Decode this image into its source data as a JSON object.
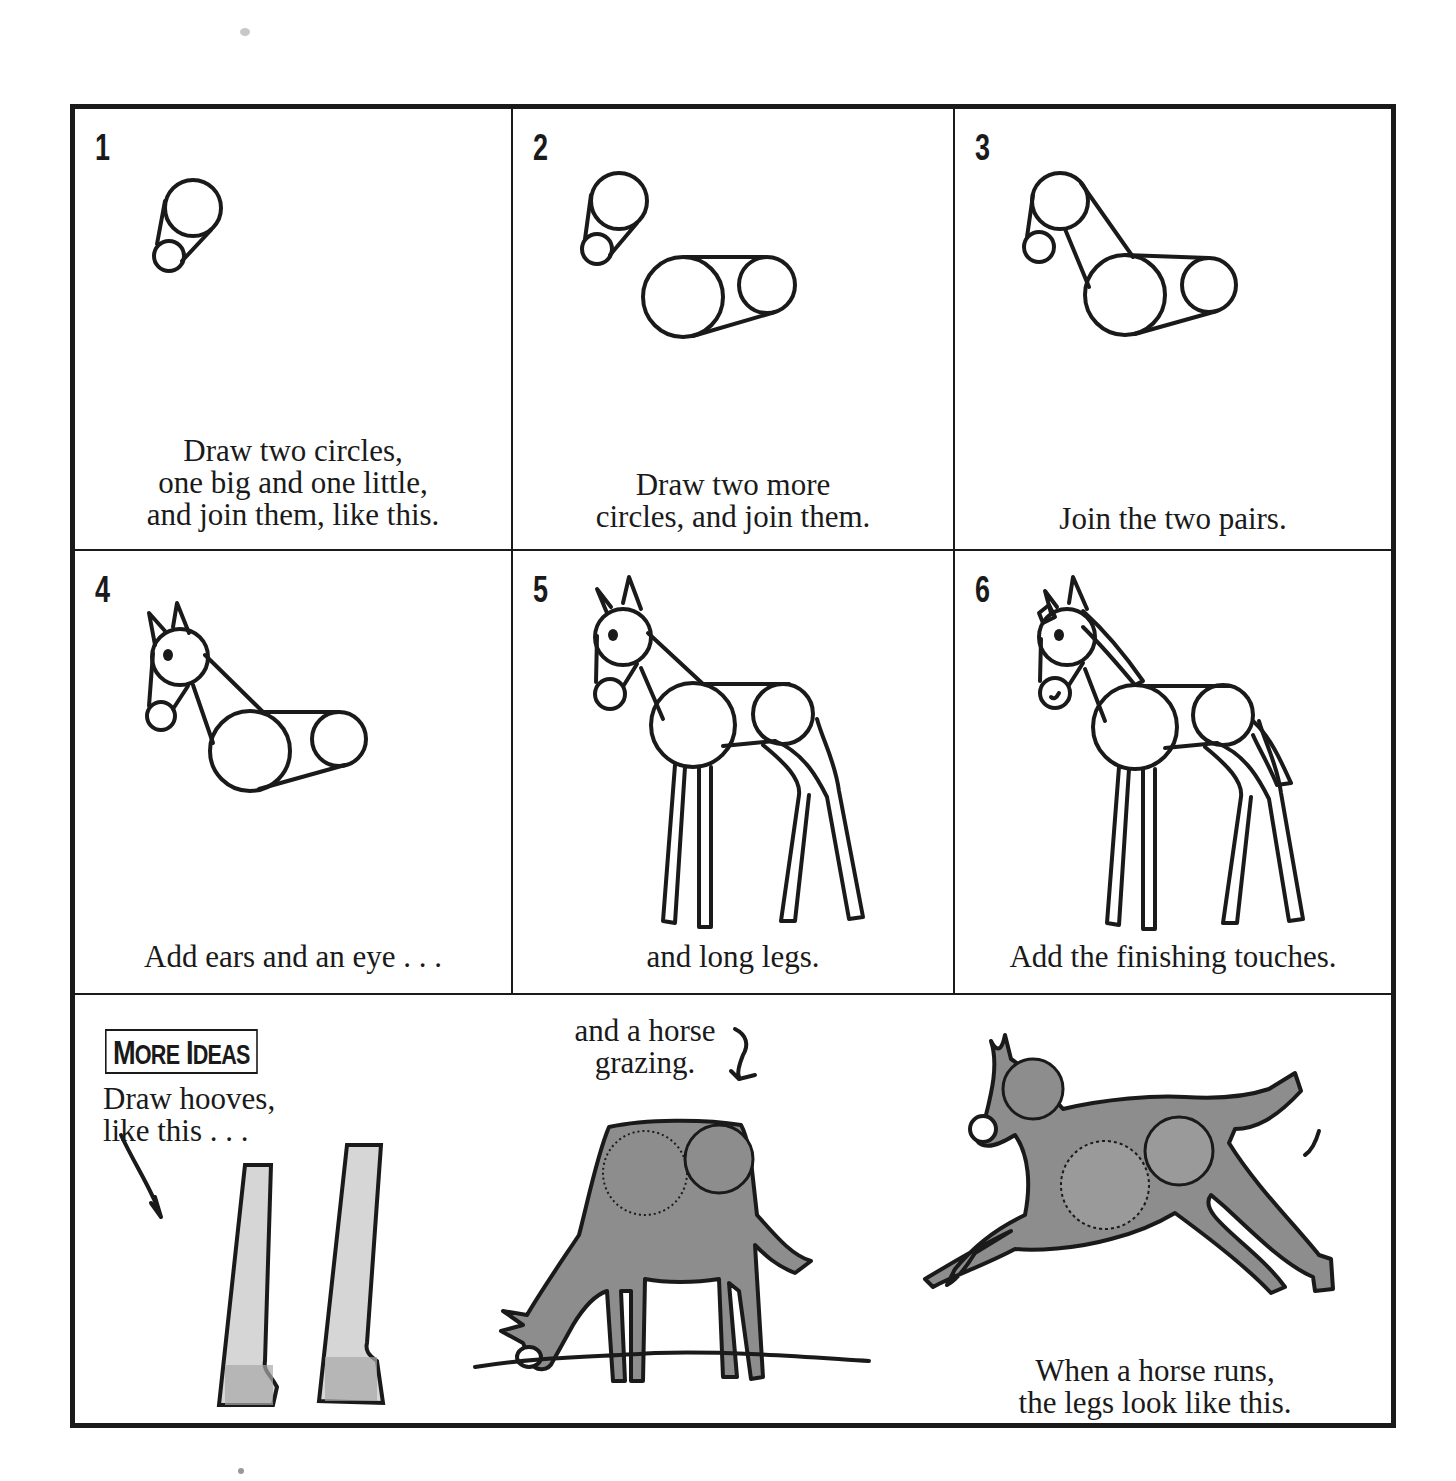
{
  "page": {
    "colors": {
      "ink": "#1a1a1a",
      "paper": "#ffffff",
      "wash_dark": "#8d8d8d",
      "wash_light": "#b4b4b4"
    }
  },
  "steps": [
    {
      "number": "1",
      "caption_lines": [
        "Draw two circles,",
        "one big and one little,",
        "and join them, like this."
      ],
      "illustration": "head-circles-icon"
    },
    {
      "number": "2",
      "caption_lines": [
        "Draw two more",
        "circles, and join them."
      ],
      "illustration": "body-circles-icon"
    },
    {
      "number": "3",
      "caption_lines": [
        "Join the two pairs."
      ],
      "illustration": "joined-circles-icon"
    },
    {
      "number": "4",
      "caption_lines": [
        "Add ears and an eye . . ."
      ],
      "illustration": "horse-ears-eye-icon"
    },
    {
      "number": "5",
      "caption_lines": [
        "and long legs."
      ],
      "illustration": "horse-legs-icon"
    },
    {
      "number": "6",
      "caption_lines": [
        "Add the finishing touches."
      ],
      "illustration": "horse-finished-icon"
    }
  ],
  "more_ideas": {
    "heading_first_big": "M",
    "heading_first_rest": "ORE",
    "heading_second_big": "I",
    "heading_second_rest": "DEAS",
    "hooves_lines": [
      "Draw hooves,",
      "like this . . ."
    ],
    "grazing_lines": [
      "and a horse",
      "grazing."
    ],
    "running_lines": [
      "When a horse runs,",
      "the legs look like this."
    ]
  }
}
